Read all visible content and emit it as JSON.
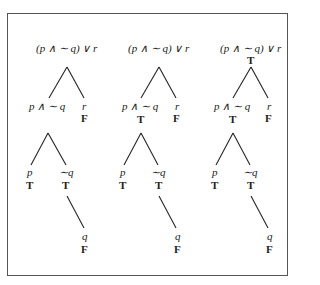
{
  "diagram": {
    "type": "truth-value-tree",
    "frame": {
      "border_color": "#555555"
    },
    "trees": [
      {
        "root": {
          "label": "(p ∧ ∼ q) ∨ r",
          "value": ""
        },
        "left": {
          "label": "p ∧ ∼ q",
          "value": ""
        },
        "right": {
          "label": "r",
          "value": "F"
        },
        "leaf_p": {
          "label": "p",
          "value": "T"
        },
        "leaf_nq": {
          "label": "∼q",
          "value": "T"
        },
        "leaf_q": {
          "label": "q",
          "value": "F"
        }
      },
      {
        "root": {
          "label": "(p ∧ ∼ q) ∨ r",
          "value": ""
        },
        "left": {
          "label": "p ∧ ∼ q",
          "value": "T"
        },
        "right": {
          "label": "r",
          "value": "F"
        },
        "leaf_p": {
          "label": "p",
          "value": "T"
        },
        "leaf_nq": {
          "label": "∼q",
          "value": "T"
        },
        "leaf_q": {
          "label": "q",
          "value": "F"
        }
      },
      {
        "root": {
          "label": "(p ∧ ∼ q) ∨ r",
          "value": "T"
        },
        "left": {
          "label": "p ∧ ∼ q",
          "value": "T"
        },
        "right": {
          "label": "r",
          "value": "F"
        },
        "leaf_p": {
          "label": "p",
          "value": "T"
        },
        "leaf_nq": {
          "label": "∼q",
          "value": "T"
        },
        "leaf_q": {
          "label": "q",
          "value": "F"
        }
      }
    ]
  }
}
